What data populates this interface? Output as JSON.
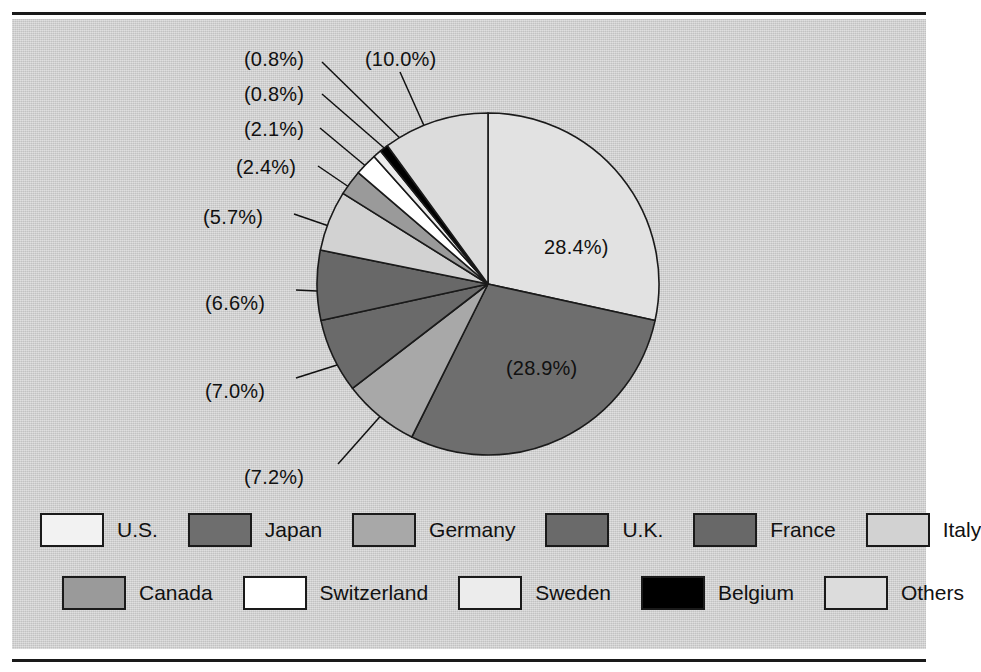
{
  "figure": {
    "background_color": "#cfcfcf",
    "rule_color": "#1a1a1a",
    "label_color": "#111111"
  },
  "chart_data": {
    "type": "pie",
    "title": "",
    "subtitle": "",
    "xlabel": "",
    "ylabel": "",
    "legend_position": "bottom",
    "grid": false,
    "start_angle_deg": 90,
    "direction": "clockwise",
    "center": {
      "x": 488,
      "y": 284
    },
    "radius": 171,
    "categories": [
      "U.S.",
      "Japan",
      "Germany",
      "U.K.",
      "France",
      "Italy",
      "Canada",
      "Switzerland",
      "Sweden",
      "Belgium",
      "Others"
    ],
    "values": [
      28.4,
      28.9,
      7.2,
      7.0,
      6.6,
      5.7,
      2.4,
      2.1,
      0.8,
      0.8,
      10.0
    ],
    "value_labels": [
      "28.4%)",
      "(28.9%)",
      "(7.2%)",
      "(7.0%)",
      "(6.6%)",
      "(5.7%)",
      "(2.4%)",
      "(2.1%)",
      "(0.8%)",
      "(0.8%)",
      "(10.0%)"
    ],
    "slice_colors": [
      "#e2e2e2",
      "#6e6e6e",
      "#a8a8a8",
      "#6a6a6a",
      "#686868",
      "#d2d2d2",
      "#9a9a9a",
      "#ffffff",
      "#ececec",
      "#000000",
      "#dcdcdc"
    ],
    "slice_edge_color": "#1a1a1a"
  },
  "slices": [
    {
      "name": "U.S.",
      "percent": 28.4,
      "label": "28.4%)",
      "color": "#e2e2e2",
      "label_pos": {
        "x": 544,
        "y": 236
      },
      "leader": false
    },
    {
      "name": "Japan",
      "percent": 28.9,
      "label": "(28.9%)",
      "color": "#6e6e6e",
      "label_pos": {
        "x": 506,
        "y": 357
      },
      "leader": false
    },
    {
      "name": "Germany",
      "percent": 7.2,
      "label": "(7.2%)",
      "color": "#a8a8a8",
      "label_pos": {
        "x": 244,
        "y": 466
      },
      "leader": true,
      "leader_from": {
        "x": 338,
        "y": 464
      },
      "leader_to": {
        "x": 400,
        "y": 394
      }
    },
    {
      "name": "U.K.",
      "percent": 7.0,
      "label": "(7.0%)",
      "color": "#6a6a6a",
      "label_pos": {
        "x": 205,
        "y": 380
      },
      "leader": true,
      "leader_from": {
        "x": 296,
        "y": 378
      },
      "leader_to": {
        "x": 378,
        "y": 352
      }
    },
    {
      "name": "France",
      "percent": 6.6,
      "label": "(6.6%)",
      "color": "#686868",
      "label_pos": {
        "x": 205,
        "y": 292
      },
      "leader": true,
      "leader_from": {
        "x": 296,
        "y": 290
      },
      "leader_to": {
        "x": 338,
        "y": 292
      }
    },
    {
      "name": "Italy",
      "percent": 5.7,
      "label": "(5.7%)",
      "color": "#d2d2d2",
      "label_pos": {
        "x": 203,
        "y": 206
      },
      "leader": true,
      "leader_from": {
        "x": 294,
        "y": 214
      },
      "leader_to": {
        "x": 352,
        "y": 234
      }
    },
    {
      "name": "Canada",
      "percent": 2.4,
      "label": "(2.4%)",
      "color": "#9a9a9a",
      "label_pos": {
        "x": 236,
        "y": 156
      },
      "leader": true,
      "leader_from": {
        "x": 318,
        "y": 166
      },
      "leader_to": {
        "x": 368,
        "y": 200
      }
    },
    {
      "name": "Switzerland",
      "percent": 2.1,
      "label": "(2.1%)",
      "color": "#ffffff",
      "label_pos": {
        "x": 244,
        "y": 118
      },
      "leader": true,
      "leader_from": {
        "x": 320,
        "y": 128
      },
      "leader_to": {
        "x": 380,
        "y": 178
      }
    },
    {
      "name": "Sweden",
      "percent": 0.8,
      "label": "(0.8%)",
      "color": "#ececec",
      "label_pos": {
        "x": 244,
        "y": 83
      },
      "leader": true,
      "leader_from": {
        "x": 322,
        "y": 94
      },
      "leader_to": {
        "x": 398,
        "y": 160
      }
    },
    {
      "name": "Belgium",
      "percent": 0.8,
      "label": "(0.8%)",
      "color": "#000000",
      "label_pos": {
        "x": 244,
        "y": 48
      },
      "leader": true,
      "leader_from": {
        "x": 322,
        "y": 62
      },
      "leader_to": {
        "x": 408,
        "y": 146
      }
    },
    {
      "name": "Others",
      "percent": 10.0,
      "label": "(10.0%)",
      "color": "#dcdcdc",
      "label_pos": {
        "x": 365,
        "y": 48
      },
      "leader": true,
      "leader_from": {
        "x": 400,
        "y": 72
      },
      "leader_to": {
        "x": 434,
        "y": 148
      }
    }
  ],
  "legend": {
    "rows": [
      [
        {
          "label": "U.S.",
          "color": "#f2f2f2"
        },
        {
          "label": "Japan",
          "color": "#6e6e6e"
        },
        {
          "label": "Germany",
          "color": "#a8a8a8"
        },
        {
          "label": "U.K.",
          "color": "#6a6a6a"
        },
        {
          "label": "France",
          "color": "#686868"
        },
        {
          "label": "Italy",
          "color": "#d2d2d2"
        }
      ],
      [
        {
          "label": "Canada",
          "color": "#9a9a9a"
        },
        {
          "label": "Switzerland",
          "color": "#ffffff"
        },
        {
          "label": "Sweden",
          "color": "#ececec"
        },
        {
          "label": "Belgium",
          "color": "#000000"
        },
        {
          "label": "Others",
          "color": "#dcdcdc"
        }
      ]
    ]
  }
}
